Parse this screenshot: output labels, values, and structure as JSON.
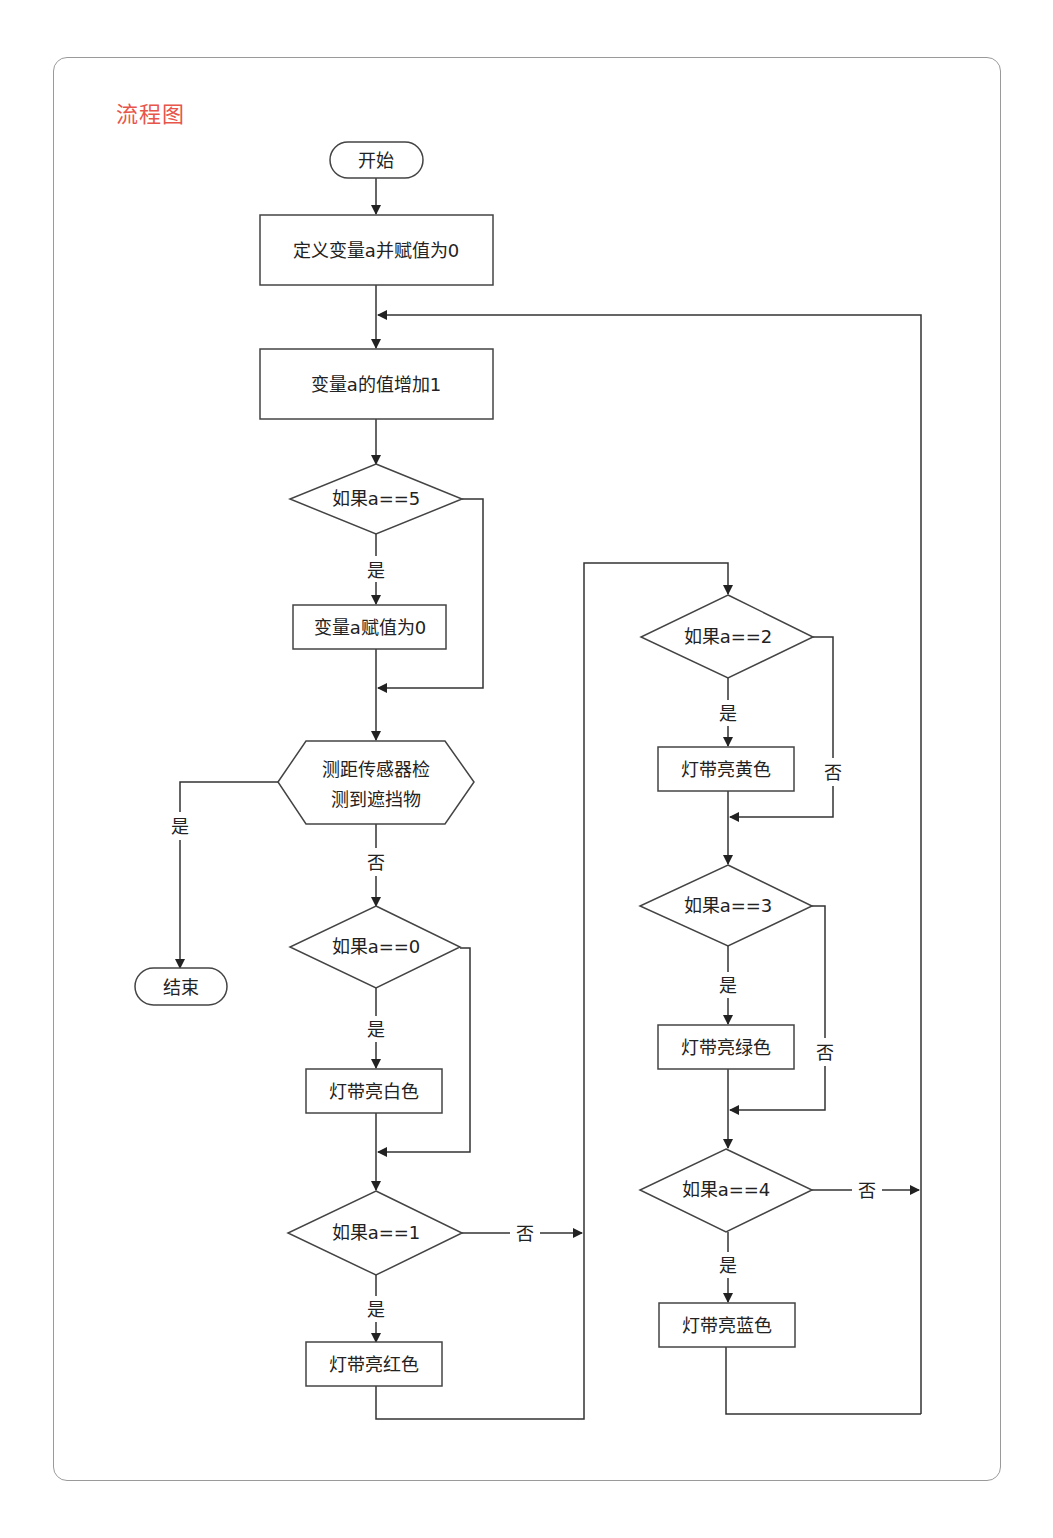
{
  "title": "流程图",
  "colors": {
    "title": "#e8554a",
    "stroke": "#444444"
  },
  "nodes": {
    "start": "开始",
    "init": "定义变量a并赋值为0",
    "increment": "变量a的值增加1",
    "check5": "如果a==5",
    "reset": "变量a赋值为0",
    "sensor_line1": "测距传感器检",
    "sensor_line2": "测到遮挡物",
    "end": "结束",
    "check0": "如果a==0",
    "white": "灯带亮白色",
    "check1": "如果a==1",
    "red": "灯带亮红色",
    "check2": "如果a==2",
    "yellow": "灯带亮黄色",
    "check3": "如果a==3",
    "green": "灯带亮绿色",
    "check4": "如果a==4",
    "blue": "灯带亮蓝色"
  },
  "edge_labels": {
    "check5_yes": "是",
    "sensor_yes": "是",
    "sensor_no": "否",
    "check0_yes": "是",
    "check1_yes": "是",
    "check1_no": "否",
    "check2_yes": "是",
    "check2_no": "否",
    "check3_yes": "是",
    "check3_no": "否",
    "check4_yes": "是",
    "check4_no": "否"
  }
}
